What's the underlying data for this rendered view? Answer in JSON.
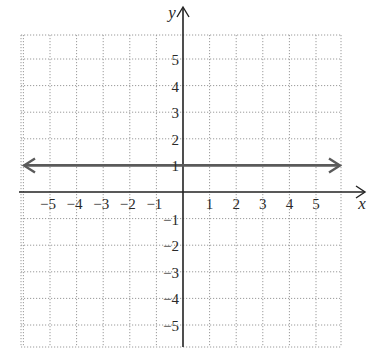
{
  "chart_data": {
    "type": "line",
    "title": "",
    "xlabel": "x",
    "ylabel": "y",
    "xlim": [
      -6,
      6
    ],
    "ylim": [
      -5.8,
      5.8
    ],
    "grid": true,
    "x_ticks": [
      -5,
      -4,
      -3,
      -2,
      -1,
      1,
      2,
      3,
      4,
      5
    ],
    "y_ticks": [
      -5,
      -4,
      -3,
      -2,
      -1,
      1,
      2,
      3,
      4,
      5
    ],
    "x_tick_labels": [
      "−5",
      "−4",
      "−3",
      "−2",
      "−1",
      "1",
      "2",
      "3",
      "4",
      "5"
    ],
    "y_tick_labels": [
      "−5",
      "−4",
      "−3",
      "−2",
      "−1",
      "1",
      "2",
      "3",
      "4",
      "5"
    ],
    "series": [
      {
        "name": "y = 1",
        "equation": "y = 1",
        "x": [
          -6,
          6
        ],
        "y": [
          1,
          1
        ],
        "arrows": "both",
        "color": "#555555"
      }
    ]
  },
  "colors": {
    "grid": "#9a9a9a",
    "axis": "#222222",
    "line": "#5a5a5a"
  }
}
